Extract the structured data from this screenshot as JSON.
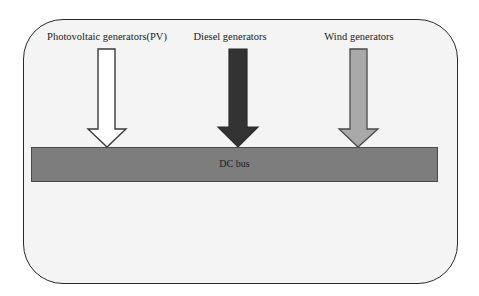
{
  "diagram": {
    "sources": [
      {
        "label": "Photovoltaic generators(PV)",
        "arrow_fill": "#ffffff",
        "center_x": 107
      },
      {
        "label": "Diesel generators",
        "arrow_fill": "#333333",
        "center_x": 238
      },
      {
        "label": "Wind generators",
        "arrow_fill": "#a9a9a9",
        "center_x": 358
      }
    ],
    "bus": {
      "label": "DC bus",
      "fill": "#7d7d7d"
    },
    "frame": {
      "fill": "#f4f4f4",
      "stroke": "#2a2a2a"
    }
  }
}
